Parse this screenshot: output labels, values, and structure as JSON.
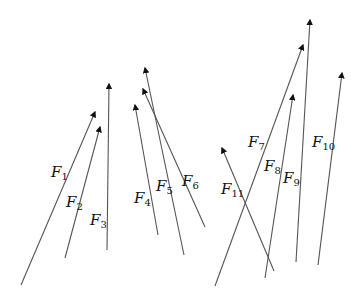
{
  "diagram": {
    "line_color": "#555555",
    "vectors": [
      {
        "name": "F",
        "sub": "1",
        "from": [
          21,
          285
        ],
        "to": [
          95,
          112
        ],
        "label_pos": [
          51,
          165
        ]
      },
      {
        "name": "F",
        "sub": "2",
        "from": [
          65,
          258
        ],
        "to": [
          100,
          127
        ],
        "label_pos": [
          66,
          195
        ]
      },
      {
        "name": "F",
        "sub": "3",
        "from": [
          107,
          250
        ],
        "to": [
          109,
          84
        ],
        "label_pos": [
          90,
          213
        ]
      },
      {
        "name": "F",
        "sub": "4",
        "from": [
          158,
          235
        ],
        "to": [
          135,
          105
        ],
        "label_pos": [
          134,
          191
        ]
      },
      {
        "name": "F",
        "sub": "5",
        "from": [
          184,
          255
        ],
        "to": [
          145,
          68
        ],
        "label_pos": [
          156,
          179
        ]
      },
      {
        "name": "F",
        "sub": "6",
        "from": [
          205,
          227
        ],
        "to": [
          143,
          89
        ],
        "label_pos": [
          182,
          174
        ]
      },
      {
        "name": "F",
        "sub": "7",
        "from": [
          215,
          286
        ],
        "to": [
          303,
          45
        ],
        "label_pos": [
          248,
          135
        ]
      },
      {
        "name": "F",
        "sub": "8",
        "from": [
          265,
          278
        ],
        "to": [
          293,
          95
        ],
        "label_pos": [
          264,
          159
        ]
      },
      {
        "name": "F",
        "sub": "9",
        "from": [
          296,
          262
        ],
        "to": [
          310,
          20
        ],
        "label_pos": [
          283,
          171
        ]
      },
      {
        "name": "F",
        "sub": "10",
        "from": [
          318,
          265
        ],
        "to": [
          342,
          73
        ],
        "label_pos": [
          312,
          135
        ]
      },
      {
        "name": "F",
        "sub": "11",
        "from": [
          274,
          271
        ],
        "to": [
          222,
          148
        ],
        "label_pos": [
          221,
          182
        ]
      }
    ]
  }
}
